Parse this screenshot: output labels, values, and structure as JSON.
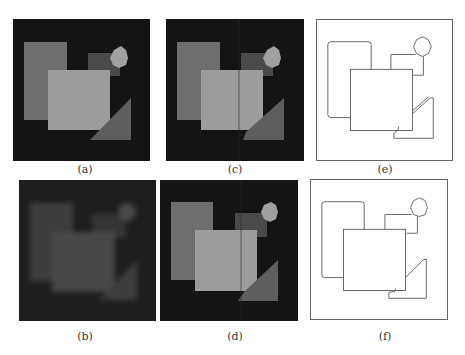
{
  "figure": {
    "panels": [
      {
        "id": "a",
        "caption": "(a)",
        "kind": "original-image"
      },
      {
        "id": "c",
        "caption": "(c)",
        "kind": "restored-image"
      },
      {
        "id": "e",
        "caption": "(e)",
        "kind": "edge-map"
      },
      {
        "id": "b",
        "caption": "(b)",
        "kind": "blurred-image"
      },
      {
        "id": "d",
        "caption": "(d)",
        "kind": "restored-image"
      },
      {
        "id": "f",
        "caption": "(f)",
        "kind": "edge-map"
      }
    ],
    "colors": {
      "background": "#141414",
      "left_rect": "#6e6e6e",
      "small_rect": "#4a4a4a",
      "center_square": "#9c9c9c",
      "triangle": "#5e5e5e",
      "octagon": "#a0a0a0",
      "blur_tint": "#3e3e3e",
      "edge_line": "#444444"
    }
  }
}
